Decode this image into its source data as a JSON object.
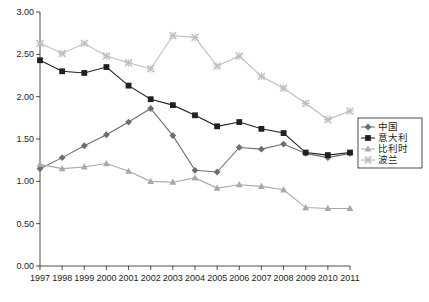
{
  "chart_data": {
    "type": "line",
    "title": "",
    "xlabel": "",
    "ylabel": "",
    "grid": false,
    "legend_position": "right-middle",
    "categories": [
      "1997",
      "1998",
      "1999",
      "2000",
      "2001",
      "2002",
      "2003",
      "2004",
      "2005",
      "2006",
      "2007",
      "2008",
      "2009",
      "2010",
      "2011"
    ],
    "ylim": [
      0.0,
      3.0
    ],
    "yticks": [
      "0.00",
      "0.50",
      "1.00",
      "1.50",
      "2.00",
      "2.50",
      "3.00"
    ],
    "series": [
      {
        "name": "中国",
        "marker": "diamond",
        "color": "#6d6e71",
        "values": [
          1.15,
          1.28,
          1.42,
          1.55,
          1.7,
          1.86,
          1.54,
          1.13,
          1.11,
          1.4,
          1.38,
          1.44,
          1.33,
          1.28,
          1.33
        ]
      },
      {
        "name": "意大利",
        "marker": "square",
        "color": "#231f20",
        "values": [
          2.43,
          2.3,
          2.28,
          2.35,
          2.13,
          1.97,
          1.9,
          1.78,
          1.65,
          1.7,
          1.62,
          1.57,
          1.34,
          1.31,
          1.34
        ]
      },
      {
        "name": "比利时",
        "marker": "triangle",
        "color": "#a7a9ac",
        "values": [
          1.2,
          1.15,
          1.17,
          1.21,
          1.12,
          1.0,
          0.99,
          1.04,
          0.92,
          0.96,
          0.94,
          0.9,
          0.69,
          0.68,
          0.68
        ]
      },
      {
        "name": "波兰",
        "marker": "cross",
        "color": "#bcbec0",
        "values": [
          2.63,
          2.51,
          2.63,
          2.48,
          2.4,
          2.33,
          2.72,
          2.7,
          2.36,
          2.48,
          2.24,
          2.1,
          1.92,
          1.73,
          1.83
        ]
      }
    ]
  }
}
